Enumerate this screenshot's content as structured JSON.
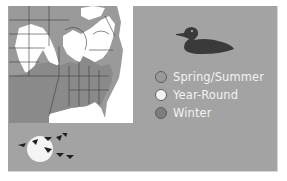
{
  "colors": {
    "panel_bg": "#a3a3a3",
    "spring_summer": "#9a9a9a",
    "year_round": "#f3f3f3",
    "winter": "#7d7d7d",
    "map_winter": "#8a8a8a",
    "map_land": "#ffffff",
    "duck": "#3a3a3a"
  },
  "map": {
    "label": "range-map-eastern-north-america"
  },
  "legend": {
    "items": [
      {
        "label": "Spring/Summer",
        "color": "#9a9a9a"
      },
      {
        "label": "Year-Round",
        "color": "#f3f3f3"
      },
      {
        "label": "Winter",
        "color": "#7d7d7d"
      }
    ]
  }
}
